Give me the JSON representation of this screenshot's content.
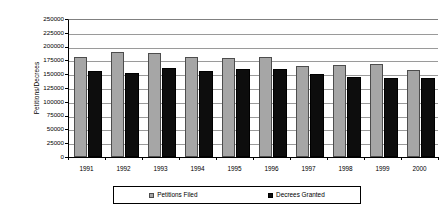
{
  "chart_data": {
    "type": "bar",
    "title": "",
    "xlabel": "",
    "ylabel": "Petitions/Decrees",
    "ylim": [
      0,
      250000
    ],
    "ytick_step": 25000,
    "grid": true,
    "legend_position": "bottom",
    "categories": [
      "1991",
      "1992",
      "1993",
      "1994",
      "1995",
      "1996",
      "1997",
      "1998",
      "1999",
      "2000"
    ],
    "ytick_labels": [
      "250000",
      "225000",
      "200000",
      "175000",
      "150000",
      "125000",
      "100000",
      "75000",
      "50000",
      "25000",
      "0"
    ],
    "series": [
      {
        "name": "Petitions Filed",
        "color": "#a6a6a6",
        "values": [
          182000,
          191000,
          188000,
          181000,
          179000,
          182000,
          165000,
          167000,
          169000,
          157000
        ]
      },
      {
        "name": "Decrees Granted",
        "color": "#0d0d0d",
        "values": [
          155000,
          152000,
          162000,
          156000,
          159000,
          160000,
          150000,
          145000,
          144000,
          144000
        ]
      }
    ]
  },
  "legend": {
    "entries": [
      {
        "label": "Petitions Filed",
        "swatch": "filed"
      },
      {
        "label": "Decrees Granted",
        "swatch": "granted"
      }
    ]
  }
}
